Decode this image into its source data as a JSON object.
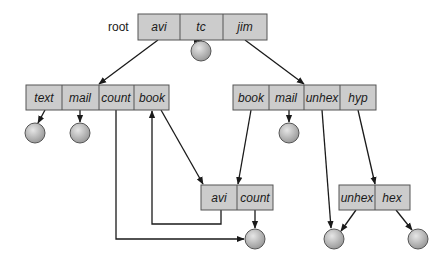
{
  "diagram": {
    "type": "acyclic-graph directory structure",
    "root_label": "root",
    "colors": {
      "cell_fill": "#cccccc",
      "cell_border": "#555555",
      "line": "#1a1a1a",
      "file_fill": "#b8b8b8"
    },
    "directories": [
      {
        "id": "root",
        "cells": [
          "avi",
          "tc",
          "jim"
        ]
      },
      {
        "id": "avi-dir",
        "cells": [
          "text",
          "mail",
          "count",
          "book"
        ]
      },
      {
        "id": "jim-dir",
        "cells": [
          "book",
          "mail",
          "unhex",
          "hyp"
        ]
      },
      {
        "id": "shared-dir",
        "cells": [
          "avi",
          "count"
        ]
      },
      {
        "id": "hyp-dir",
        "cells": [
          "unhex",
          "hex"
        ]
      }
    ],
    "edges": [
      {
        "from": "root/avi",
        "to": "avi-dir"
      },
      {
        "from": "root/tc",
        "to": "file"
      },
      {
        "from": "root/jim",
        "to": "jim-dir"
      },
      {
        "from": "avi-dir/text",
        "to": "file"
      },
      {
        "from": "avi-dir/mail",
        "to": "file"
      },
      {
        "from": "avi-dir/count",
        "to": "shared-file"
      },
      {
        "from": "avi-dir/book",
        "to": "shared-dir"
      },
      {
        "from": "jim-dir/book",
        "to": "shared-dir"
      },
      {
        "from": "jim-dir/mail",
        "to": "file"
      },
      {
        "from": "jim-dir/unhex",
        "to": "unhex-file"
      },
      {
        "from": "jim-dir/hyp",
        "to": "hyp-dir"
      },
      {
        "from": "shared-dir/avi",
        "to": "avi-dir/book"
      },
      {
        "from": "shared-dir/count",
        "to": "shared-file"
      },
      {
        "from": "hyp-dir/unhex",
        "to": "unhex-file"
      },
      {
        "from": "hyp-dir/hex",
        "to": "file"
      }
    ]
  }
}
